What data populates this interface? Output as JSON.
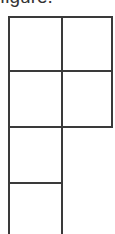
{
  "caption": {
    "text": "figure."
  },
  "diagram": {
    "type": "grid-shape",
    "stroke_color": "#3a3a3a",
    "rows": [
      {
        "cells": 2
      },
      {
        "cells": 2
      },
      {
        "cells": 1
      },
      {
        "cells": 1
      }
    ]
  }
}
